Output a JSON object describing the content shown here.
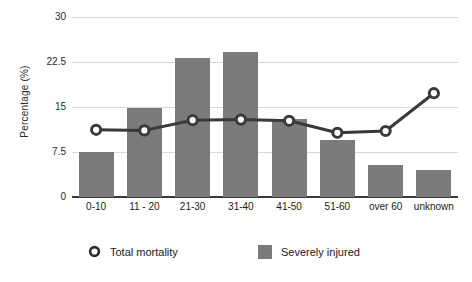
{
  "chart_data": {
    "type": "bar",
    "title": "",
    "xlabel": "",
    "ylabel": "Percentage (%)",
    "ylim": [
      0,
      30
    ],
    "yticks": [
      0,
      7.5,
      15,
      22.5,
      30
    ],
    "ytick_labels": [
      "0",
      "7.5",
      "15",
      "22.5",
      "30"
    ],
    "grid": true,
    "legend_position": "bottom",
    "categories": [
      "0-10",
      "11 - 20",
      "21-30",
      "31-40",
      "41-50",
      "51-60",
      "over 60",
      "unknown"
    ],
    "series": [
      {
        "name": "Severely injured",
        "type": "bar",
        "color": "#7b7b7b",
        "values": [
          7.5,
          14.8,
          23.2,
          24.2,
          13.0,
          9.5,
          5.3,
          4.5
        ]
      },
      {
        "name": "Total mortality",
        "type": "line",
        "color": "#3a3a3a",
        "marker": "circle-open",
        "values": [
          11.2,
          11.1,
          12.8,
          12.9,
          12.7,
          10.7,
          11.0,
          17.3
        ]
      }
    ]
  },
  "legend": {
    "items": [
      {
        "label": "Total mortality",
        "marker": "circle-open-icon"
      },
      {
        "label": "Severely injured",
        "marker": "square-swatch-icon"
      }
    ]
  }
}
